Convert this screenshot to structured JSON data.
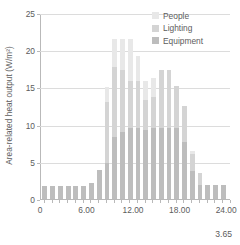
{
  "chart_data": {
    "type": "bar",
    "stacked": true,
    "title": "",
    "xlabel": "",
    "ylabel": "Area-related heat output (W/m²)",
    "ylim": [
      0,
      25
    ],
    "xlim": [
      0,
      24.5
    ],
    "grid": true,
    "legend_position": "top-right",
    "categories": [
      "0.00",
      "1.00",
      "2.00",
      "3.00",
      "4.00",
      "5.00",
      "6.00",
      "7.00",
      "8.00",
      "9.00",
      "10.00",
      "11.00",
      "12.00",
      "13.00",
      "14.00",
      "15.00",
      "16.00",
      "17.00",
      "18.00",
      "19.00",
      "20.00",
      "21.00",
      "22.00",
      "23.00"
    ],
    "series": [
      {
        "name": "Equipment",
        "color": "#bdbdbd",
        "values": [
          1.8,
          1.8,
          1.8,
          1.8,
          1.8,
          1.8,
          2.2,
          3.9,
          4.9,
          8.4,
          9.0,
          9.6,
          9.5,
          9.3,
          9.5,
          9.5,
          9.5,
          9.5,
          7.7,
          3.7,
          1.9,
          1.9,
          1.9,
          1.9
        ]
      },
      {
        "name": "Lighting",
        "color": "#d4d4d4",
        "values": [
          0.0,
          0.0,
          0.0,
          0.0,
          0.0,
          0.0,
          0.0,
          0.0,
          8.2,
          9.4,
          8.4,
          6.2,
          6.4,
          4.0,
          4.2,
          7.8,
          7.9,
          5.7,
          4.8,
          2.3,
          1.6,
          0.0,
          0.0,
          0.0
        ]
      },
      {
        "name": "People",
        "color": "#e8e8e8",
        "values": [
          0.0,
          0.0,
          0.0,
          0.0,
          0.0,
          0.0,
          0.0,
          0.0,
          1.9,
          3.7,
          4.1,
          5.7,
          3.3,
          2.5,
          2.5,
          0.0,
          0.0,
          0.0,
          0.0,
          0.4,
          0.0,
          0.0,
          0.0,
          0.0
        ]
      }
    ],
    "totals": [
      1.8,
      1.8,
      1.8,
      1.8,
      1.8,
      1.8,
      2.2,
      3.9,
      15.0,
      21.5,
      21.5,
      21.5,
      19.2,
      15.8,
      16.2,
      17.3,
      17.4,
      15.2,
      12.5,
      6.4,
      3.5,
      1.9,
      1.9,
      1.9
    ],
    "yticks": [
      {
        "value": 0,
        "label": "0"
      },
      {
        "value": 5,
        "label": "5"
      },
      {
        "value": 10,
        "label": "10"
      },
      {
        "value": 15,
        "label": "15"
      },
      {
        "value": 20,
        "label": "20"
      },
      {
        "value": 25,
        "label": "25"
      }
    ],
    "xticks": [
      {
        "value": 0,
        "label": "0"
      },
      {
        "value": 6,
        "label": "6.00"
      },
      {
        "value": 12,
        "label": "12.00"
      },
      {
        "value": 18,
        "label": "18.00"
      },
      {
        "value": 24,
        "label": "24.00"
      }
    ],
    "annotations": [
      {
        "name": "corner-note",
        "text": "3.65"
      }
    ]
  },
  "legend": {
    "items": [
      {
        "label": "People",
        "color": "#e8e8e8"
      },
      {
        "label": "Lighting",
        "color": "#d4d4d4"
      },
      {
        "label": "Equipment",
        "color": "#bdbdbd"
      }
    ]
  },
  "colors": {
    "axis": "#b9b9b9",
    "grid": "#dcdcdc",
    "text": "#5c5c5c",
    "background": "#ffffff"
  },
  "corner_note": "3.65"
}
